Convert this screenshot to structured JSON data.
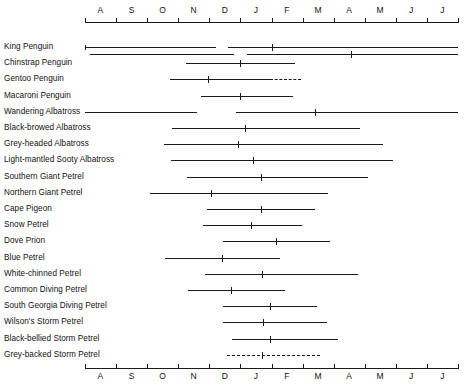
{
  "chart_data": {
    "type": "table",
    "title": "",
    "subtitle": "",
    "xlabel": "",
    "ylabel": "",
    "grid": false,
    "legend": "none",
    "axis": {
      "months": [
        "A",
        "S",
        "O",
        "N",
        "D",
        "J",
        "F",
        "M",
        "A",
        "M",
        "J",
        "J"
      ],
      "tick_count": 13,
      "x_start_month_index": 0,
      "x_end_month_index": 12,
      "top_labels_position": "above-axis",
      "bottom_labels_position": "below-axis"
    },
    "note": "Breeding season spans; x units are months from Aug (0) to Jul (12). Peak marks shown as short vertical ticks.",
    "species": [
      {
        "name": "King Penguin",
        "rows": [
          {
            "segments": [
              {
                "start": 0.0,
                "end": 4.2,
                "style": "solid",
                "start_cap": true
              },
              {
                "start": 4.6,
                "end": 12.0,
                "style": "solid",
                "start_cap": false
              }
            ],
            "peaks": [
              6.0
            ]
          },
          {
            "segments": [
              {
                "start": 0.15,
                "end": 4.8,
                "style": "solid",
                "start_cap": false
              },
              {
                "start": 5.2,
                "end": 12.0,
                "style": "solid",
                "start_cap": false
              }
            ],
            "peaks": [
              8.55
            ]
          }
        ]
      },
      {
        "name": "Chinstrap Penguin",
        "rows": [
          {
            "segments": [
              {
                "start": 3.25,
                "end": 6.75,
                "style": "solid",
                "start_cap": false
              }
            ],
            "peaks": [
              4.98
            ]
          }
        ]
      },
      {
        "name": "Gentoo Penguin",
        "rows": [
          {
            "segments": [
              {
                "start": 2.73,
                "end": 5.95,
                "style": "solid",
                "start_cap": false
              },
              {
                "start": 5.95,
                "end": 6.95,
                "style": "dashed",
                "start_cap": false
              }
            ],
            "peaks": [
              3.95
            ]
          }
        ]
      },
      {
        "name": "Macaroni Penguin",
        "rows": [
          {
            "segments": [
              {
                "start": 3.74,
                "end": 6.7,
                "style": "solid",
                "start_cap": false
              }
            ],
            "peaks": [
              4.98
            ]
          }
        ]
      },
      {
        "name": "Wandering Albatross",
        "rows": [
          {
            "segments": [
              {
                "start": 0.0,
                "end": 3.6,
                "style": "solid",
                "start_cap": false
              },
              {
                "start": 4.86,
                "end": 12.0,
                "style": "solid",
                "start_cap": false
              }
            ],
            "peaks": [
              7.4
            ]
          }
        ]
      },
      {
        "name": "Black-browed Albatross",
        "rows": [
          {
            "segments": [
              {
                "start": 2.8,
                "end": 8.85,
                "style": "solid",
                "start_cap": false
              }
            ],
            "peaks": [
              5.15
            ]
          }
        ]
      },
      {
        "name": "Grey-headed Albatross",
        "rows": [
          {
            "segments": [
              {
                "start": 2.54,
                "end": 9.59,
                "style": "solid",
                "start_cap": false
              }
            ],
            "peaks": [
              4.92
            ]
          }
        ]
      },
      {
        "name": "Light-mantled Sooty Albatross",
        "rows": [
          {
            "segments": [
              {
                "start": 2.77,
                "end": 9.91,
                "style": "solid",
                "start_cap": false
              }
            ],
            "peaks": [
              5.4
            ]
          }
        ]
      },
      {
        "name": "Southern Giant Petrel",
        "rows": [
          {
            "segments": [
              {
                "start": 3.28,
                "end": 9.1,
                "style": "solid",
                "start_cap": false
              }
            ],
            "peaks": [
              5.66
            ]
          }
        ]
      },
      {
        "name": "Northern Giant Petrel",
        "rows": [
          {
            "segments": [
              {
                "start": 2.09,
                "end": 7.82,
                "style": "solid",
                "start_cap": false
              }
            ],
            "peaks": [
              4.05
            ]
          }
        ]
      },
      {
        "name": "Cape Pigeon",
        "rows": [
          {
            "segments": [
              {
                "start": 3.93,
                "end": 7.4,
                "style": "solid",
                "start_cap": false
              }
            ],
            "peaks": [
              5.66
            ]
          }
        ]
      },
      {
        "name": "Snow Petrel",
        "rows": [
          {
            "segments": [
              {
                "start": 3.8,
                "end": 6.98,
                "style": "solid",
                "start_cap": false
              }
            ],
            "peaks": [
              5.34
            ]
          }
        ]
      },
      {
        "name": "Dove Prion",
        "rows": [
          {
            "segments": [
              {
                "start": 4.44,
                "end": 7.88,
                "style": "solid",
                "start_cap": false
              }
            ],
            "peaks": [
              6.14
            ]
          }
        ]
      },
      {
        "name": "Blue Petrel",
        "rows": [
          {
            "segments": [
              {
                "start": 2.57,
                "end": 6.27,
                "style": "solid",
                "start_cap": false
              }
            ],
            "peaks": [
              4.41
            ]
          }
        ]
      },
      {
        "name": "White-chinned Petrel",
        "rows": [
          {
            "segments": [
              {
                "start": 3.86,
                "end": 8.78,
                "style": "solid",
                "start_cap": false
              }
            ],
            "peaks": [
              5.69
            ]
          }
        ]
      },
      {
        "name": "Common Diving Petrel",
        "rows": [
          {
            "segments": [
              {
                "start": 3.31,
                "end": 6.43,
                "style": "solid",
                "start_cap": false
              }
            ],
            "peaks": [
              4.7
            ]
          }
        ]
      },
      {
        "name": "South Georgia Diving Petrel",
        "rows": [
          {
            "segments": [
              {
                "start": 4.44,
                "end": 7.46,
                "style": "solid",
                "start_cap": false
              }
            ],
            "peaks": [
              5.95
            ]
          }
        ]
      },
      {
        "name": "Wilson's Storm Petrel",
        "rows": [
          {
            "segments": [
              {
                "start": 4.44,
                "end": 7.79,
                "style": "solid",
                "start_cap": false
              }
            ],
            "peaks": [
              5.72
            ]
          }
        ]
      },
      {
        "name": "Black-bellied Storm Petrel",
        "rows": [
          {
            "segments": [
              {
                "start": 4.73,
                "end": 8.14,
                "style": "solid",
                "start_cap": false
              }
            ],
            "peaks": [
              5.95
            ]
          }
        ]
      },
      {
        "name": "Grey-backed Storm Petrel",
        "rows": [
          {
            "segments": [
              {
                "start": 4.57,
                "end": 7.56,
                "style": "dashed",
                "start_cap": false
              }
            ],
            "peaks": [
              5.69
            ]
          }
        ]
      }
    ]
  }
}
